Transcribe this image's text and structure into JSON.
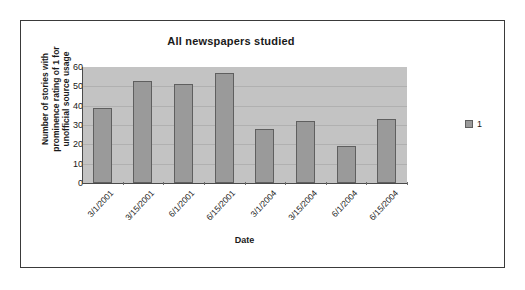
{
  "chart_data": {
    "type": "bar",
    "title": "All newspapers studied",
    "xlabel": "Date",
    "ylabel": "Number of stories with prominence rating of 1 for unofficial source usage",
    "ylabel_lines": [
      "Number of stories with",
      "prominence rating of 1 for",
      "unofficial source usage"
    ],
    "categories": [
      "3/1/2001",
      "3/15/2001",
      "6/1/2001",
      "6/15/2001",
      "3/1/2004",
      "3/15/2004",
      "6/1/2004",
      "6/15/2004"
    ],
    "values": [
      39,
      53,
      51,
      57,
      28,
      32,
      19,
      33
    ],
    "series": [
      {
        "name": "1",
        "values": [
          39,
          53,
          51,
          57,
          28,
          32,
          19,
          33
        ]
      }
    ],
    "ylim": [
      0,
      60
    ],
    "yticks": [
      60,
      50,
      40,
      30,
      20,
      10,
      0
    ],
    "grid": true,
    "legend_position": "right",
    "legend_entries": [
      "1"
    ],
    "colors": {
      "bar_fill": "#9a9a9a",
      "bar_border": "#5f5f5f",
      "plot_background": "#c3c3c3",
      "gridline": "#b0b0b0",
      "axis": "#4a4a4a",
      "text": "#1a1a1a",
      "frame_border": "#3a3a3a",
      "chart_background": "#ffffff"
    }
  }
}
